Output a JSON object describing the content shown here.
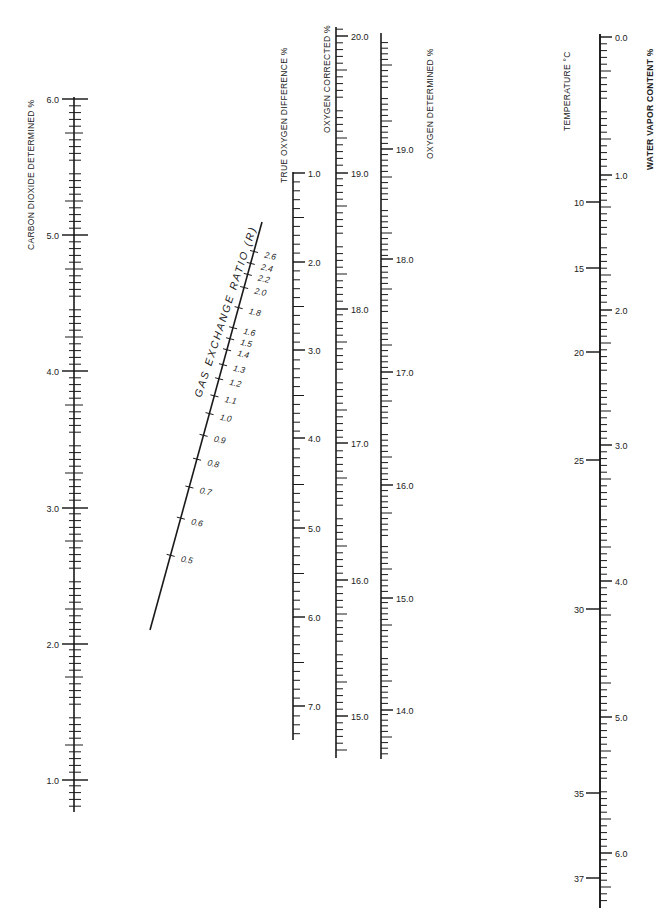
{
  "figure": {
    "type": "nomogram",
    "background": "#ffffff",
    "ink_color": "#1a1a1a"
  },
  "scales": [
    {
      "id": "co2-determined",
      "title": "CARBON DIOXIDE DETERMINED %",
      "x": 74,
      "y_top": 97,
      "y_bottom": 812,
      "labels_side": "left",
      "ticks_side": "both",
      "labels": [
        {
          "value": "6.0",
          "y": 99
        },
        {
          "value": "5.0",
          "y": 235
        },
        {
          "value": "4.0",
          "y": 371
        },
        {
          "value": "3.0",
          "y": 508
        },
        {
          "value": "2.0",
          "y": 644
        },
        {
          "value": "1.0",
          "y": 780
        }
      ],
      "minor_step_px": 6.8
    },
    {
      "id": "gas-exchange-ratio",
      "title": "GAS EXCHANGE RATIO (R)",
      "line": {
        "x1": 150,
        "y1": 630,
        "x2": 262,
        "y2": 222
      },
      "labels": [
        {
          "value": "2.6",
          "x": 252,
          "y": 251
        },
        {
          "value": "2.4",
          "x": 249,
          "y": 263
        },
        {
          "value": "2.2",
          "x": 246,
          "y": 274
        },
        {
          "value": "2.0",
          "x": 242,
          "y": 287
        },
        {
          "value": "1.8",
          "x": 236,
          "y": 307
        },
        {
          "value": "1.6",
          "x": 230,
          "y": 327
        },
        {
          "value": "1.5",
          "x": 227,
          "y": 338
        },
        {
          "value": "1.4",
          "x": 224,
          "y": 349
        },
        {
          "value": "1.3",
          "x": 220,
          "y": 364
        },
        {
          "value": "1.2",
          "x": 216,
          "y": 378
        },
        {
          "value": "1.1",
          "x": 211,
          "y": 395
        },
        {
          "value": "1.0",
          "x": 207,
          "y": 413
        },
        {
          "value": "0.9",
          "x": 202,
          "y": 435
        },
        {
          "value": "0.8",
          "x": 196,
          "y": 459
        },
        {
          "value": "0.7",
          "x": 189,
          "y": 487
        },
        {
          "value": "0.6",
          "x": 180,
          "y": 518
        },
        {
          "value": "0.5",
          "x": 169,
          "y": 555
        }
      ]
    },
    {
      "id": "true-oxygen-difference",
      "title": "TRUE OXYGEN DIFFERENCE %",
      "x": 293,
      "y_top": 172,
      "y_bottom": 740,
      "labels_side": "right",
      "ticks_side": "right",
      "labels": [
        {
          "value": "1.0",
          "y": 173
        },
        {
          "value": "2.0",
          "y": 262
        },
        {
          "value": "3.0",
          "y": 350
        },
        {
          "value": "4.0",
          "y": 438
        },
        {
          "value": "5.0",
          "y": 528
        },
        {
          "value": "6.0",
          "y": 617
        },
        {
          "value": "7.0",
          "y": 706
        }
      ],
      "minor_step_px": 8.9
    },
    {
      "id": "oxygen-corrected",
      "title": "OXYGEN CORRECTED %",
      "x": 336,
      "y_top": 27,
      "y_bottom": 758,
      "labels_side": "right",
      "ticks_side": "right",
      "labels": [
        {
          "value": "20.0",
          "y": 36
        },
        {
          "value": "19.0",
          "y": 173
        },
        {
          "value": "18.0",
          "y": 309
        },
        {
          "value": "17.0",
          "y": 443
        },
        {
          "value": "16.0",
          "y": 580
        },
        {
          "value": "15.0",
          "y": 716
        }
      ],
      "minor_step_px": 6.8
    },
    {
      "id": "oxygen-determined",
      "title": "OXYGEN DETERMINED %",
      "x": 381,
      "y_top": 33,
      "y_bottom": 759,
      "labels_side": "right",
      "ticks_side": "right",
      "labels": [
        {
          "value": "19.0",
          "y": 149
        },
        {
          "value": "18.0",
          "y": 259
        },
        {
          "value": "17.0",
          "y": 372
        },
        {
          "value": "16.0",
          "y": 485
        },
        {
          "value": "15.0",
          "y": 598
        },
        {
          "value": "14.0",
          "y": 710
        }
      ],
      "minor_step_px": 5.6
    },
    {
      "id": "temperature",
      "title": "TEMPERATURE °C",
      "x": 600,
      "y_top": 34,
      "y_bottom": 908,
      "labels_side": "left",
      "labels": [
        {
          "value": "10",
          "y": 202
        },
        {
          "value": "15",
          "y": 268
        },
        {
          "value": "20",
          "y": 352
        },
        {
          "value": "25",
          "y": 460
        },
        {
          "value": "30",
          "y": 609
        },
        {
          "value": "35",
          "y": 793
        },
        {
          "value": "37",
          "y": 878
        }
      ]
    },
    {
      "id": "water-vapor-content",
      "title": "WATER VAPOR CONTENT %",
      "x": 600,
      "y_top": 34,
      "y_bottom": 908,
      "labels_side": "right",
      "labels": [
        {
          "value": "0.0",
          "y": 37
        },
        {
          "value": "1.0",
          "y": 175
        },
        {
          "value": "2.0",
          "y": 310
        },
        {
          "value": "3.0",
          "y": 445
        },
        {
          "value": "4.0",
          "y": 581
        },
        {
          "value": "5.0",
          "y": 717
        },
        {
          "value": "6.0",
          "y": 853
        }
      ],
      "minor_step_px": 6.8
    }
  ],
  "titles": {
    "co2": "CARBON DIOXIDE DETERMINED %",
    "r": "GAS EXCHANGE RATIO (R)",
    "true_o2": "TRUE OXYGEN DIFFERENCE %",
    "o2_corrected": "OXYGEN CORRECTED %",
    "o2_determined": "OXYGEN DETERMINED %",
    "temperature": "TEMPERATURE °C",
    "water_vapor": "WATER VAPOR CONTENT %"
  }
}
